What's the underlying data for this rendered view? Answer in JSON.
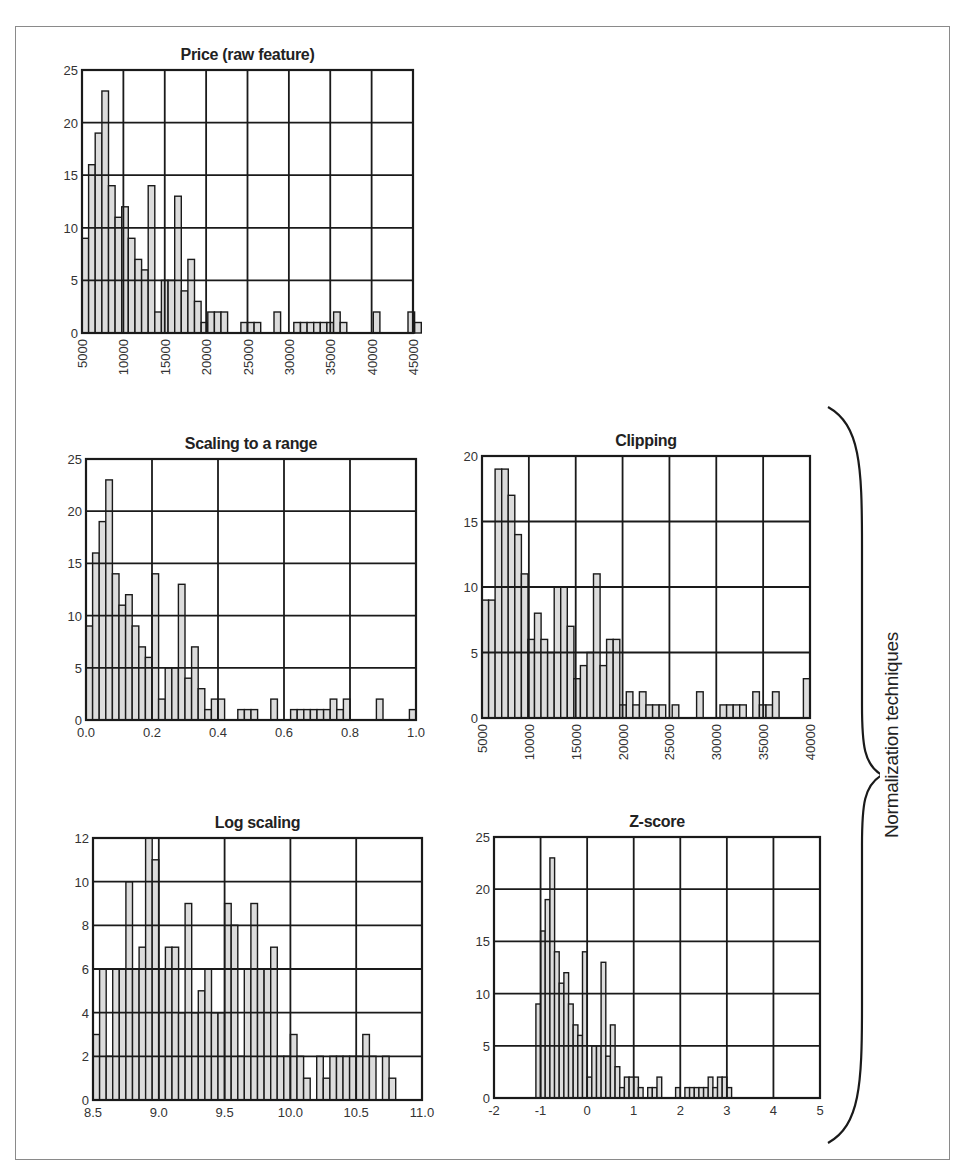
{
  "chart_data": [
    {
      "id": "price",
      "type": "bar",
      "title": "Price (raw feature)",
      "xlabel": "",
      "ylabel": "",
      "xlim": [
        5000,
        45000
      ],
      "ylim": [
        0,
        25
      ],
      "xticks": [
        "5000",
        "10000",
        "15000",
        "20000",
        "25000",
        "30000",
        "35000",
        "40000",
        "45000"
      ],
      "yticks": [
        "0",
        "5",
        "10",
        "15",
        "20",
        "25"
      ],
      "xtick_rotation": -90,
      "grid": true,
      "box": {
        "left": 82,
        "top": 70,
        "right": 413,
        "bottom": 333
      },
      "bin_width": 800,
      "bins": [
        5000,
        5800,
        6600,
        7400,
        8200,
        9000,
        9800,
        10600,
        11400,
        12200,
        13000,
        13800,
        14600,
        15400,
        16200,
        17000,
        17800,
        18600,
        19400,
        20200,
        21000,
        21800,
        24200,
        25000,
        25800,
        28200,
        30600,
        31400,
        32200,
        33000,
        33800,
        34600,
        35400,
        36200,
        40200,
        44400
      ],
      "values": [
        9,
        16,
        19,
        23,
        14,
        11,
        12,
        9,
        7,
        6,
        14,
        2,
        5,
        5,
        13,
        4,
        7,
        3,
        1,
        2,
        2,
        2,
        1,
        1,
        1,
        2,
        1,
        1,
        1,
        1,
        1,
        1,
        2,
        1,
        2,
        2,
        1
      ]
    },
    {
      "id": "scaling",
      "type": "bar",
      "title": "Scaling to a range",
      "xlim": [
        0.0,
        1.0
      ],
      "ylim": [
        0,
        25
      ],
      "xticks": [
        "0.0",
        "0.2",
        "0.4",
        "0.6",
        "0.8",
        "1.0"
      ],
      "yticks": [
        "0",
        "5",
        "10",
        "15",
        "20",
        "25"
      ],
      "xtick_rotation": 0,
      "grid": true,
      "box": {
        "left": 86,
        "top": 459,
        "right": 416,
        "bottom": 720
      },
      "bin_width": 0.02,
      "bins": [
        0.0,
        0.02,
        0.04,
        0.06,
        0.08,
        0.1,
        0.12,
        0.14,
        0.16,
        0.18,
        0.2,
        0.22,
        0.24,
        0.26,
        0.28,
        0.3,
        0.32,
        0.34,
        0.36,
        0.38,
        0.4,
        0.46,
        0.48,
        0.5,
        0.56,
        0.62,
        0.64,
        0.66,
        0.68,
        0.7,
        0.72,
        0.74,
        0.76,
        0.78,
        0.88,
        0.98
      ],
      "values": [
        9,
        16,
        19,
        23,
        14,
        11,
        12,
        9,
        7,
        6,
        14,
        2,
        5,
        5,
        13,
        4,
        7,
        3,
        1,
        2,
        2,
        1,
        1,
        1,
        2,
        1,
        1,
        1,
        1,
        1,
        1,
        2,
        1,
        2,
        2,
        1
      ]
    },
    {
      "id": "clipping",
      "type": "bar",
      "title": "Clipping",
      "xlim": [
        5000,
        40000
      ],
      "ylim": [
        0,
        20
      ],
      "xticks": [
        "5000",
        "10000",
        "15000",
        "20000",
        "25000",
        "30000",
        "35000",
        "40000"
      ],
      "yticks": [
        "0",
        "5",
        "10",
        "15",
        "20"
      ],
      "xtick_rotation": -90,
      "grid": true,
      "box": {
        "left": 482,
        "top": 456,
        "right": 810,
        "bottom": 718
      },
      "bin_width": 700,
      "bins": [
        5000,
        5700,
        6400,
        7100,
        7800,
        8500,
        9200,
        9900,
        10600,
        11300,
        12000,
        12700,
        13400,
        14100,
        14800,
        15500,
        16200,
        16900,
        17600,
        18300,
        19000,
        19700,
        20400,
        21100,
        21800,
        22500,
        23200,
        23900,
        25300,
        27900,
        30400,
        31100,
        31800,
        32500,
        33900,
        34600,
        35300,
        36000,
        39300
      ],
      "values": [
        9,
        9,
        19,
        19,
        17,
        14,
        11,
        6,
        8,
        6,
        5,
        10,
        10,
        7,
        3,
        4,
        5,
        11,
        4,
        6,
        6,
        1,
        2,
        1,
        2,
        1,
        1,
        1,
        1,
        2,
        1,
        1,
        1,
        1,
        2,
        1,
        1,
        2,
        3
      ]
    },
    {
      "id": "log",
      "type": "bar",
      "title": "Log scaling",
      "xlim": [
        8.5,
        11.0
      ],
      "ylim": [
        0,
        12
      ],
      "xticks": [
        "8.5",
        "9.0",
        "9.5",
        "10.0",
        "10.5",
        "11.0"
      ],
      "yticks": [
        "0",
        "2",
        "4",
        "6",
        "8",
        "10",
        "12"
      ],
      "xtick_rotation": 0,
      "grid": true,
      "box": {
        "left": 93,
        "top": 838,
        "right": 422,
        "bottom": 1100
      },
      "bin_width": 0.05,
      "bins": [
        8.5,
        8.55,
        8.6,
        8.65,
        8.7,
        8.75,
        8.8,
        8.85,
        8.9,
        8.95,
        9.0,
        9.05,
        9.1,
        9.15,
        9.2,
        9.25,
        9.3,
        9.35,
        9.4,
        9.45,
        9.5,
        9.55,
        9.6,
        9.65,
        9.7,
        9.75,
        9.8,
        9.85,
        9.9,
        9.95,
        10.0,
        10.05,
        10.1,
        10.2,
        10.25,
        10.3,
        10.35,
        10.4,
        10.45,
        10.5,
        10.55,
        10.6,
        10.7
      ],
      "values": [
        3,
        6,
        2,
        6,
        6,
        10,
        6,
        7,
        12,
        11,
        6,
        7,
        7,
        4,
        9,
        4,
        5,
        6,
        4,
        4,
        9,
        8,
        2,
        6,
        9,
        6,
        6,
        7,
        2,
        2,
        3,
        2,
        1,
        2,
        1,
        2,
        2,
        2,
        2,
        2,
        3,
        2,
        2,
        1
      ]
    },
    {
      "id": "zscore",
      "type": "bar",
      "title": "Z-score",
      "xlim": [
        -2,
        5
      ],
      "ylim": [
        0,
        25
      ],
      "xticks": [
        "-2",
        "-1",
        "0",
        "1",
        "2",
        "3",
        "4",
        "5"
      ],
      "yticks": [
        "0",
        "5",
        "10",
        "15",
        "20",
        "25"
      ],
      "xtick_rotation": 0,
      "grid": true,
      "box": {
        "left": 494,
        "top": 837,
        "right": 820,
        "bottom": 1098
      },
      "bin_width": 0.1,
      "bins": [
        -1.1,
        -1.0,
        -0.9,
        -0.8,
        -0.7,
        -0.6,
        -0.5,
        -0.4,
        -0.3,
        -0.2,
        -0.1,
        0.0,
        0.1,
        0.2,
        0.3,
        0.4,
        0.5,
        0.6,
        0.7,
        0.8,
        0.9,
        1.0,
        1.1,
        1.3,
        1.4,
        1.5,
        1.9,
        2.1,
        2.2,
        2.3,
        2.4,
        2.5,
        2.6,
        2.7,
        2.8,
        2.9,
        3.0,
        3.5,
        3.9
      ],
      "values": [
        9,
        16,
        19,
        23,
        14,
        11,
        12,
        9,
        7,
        6,
        14,
        2,
        5,
        5,
        13,
        4,
        7,
        3,
        1,
        2,
        2,
        2,
        1,
        1,
        1,
        2,
        1,
        1,
        1,
        1,
        1,
        1,
        2,
        1,
        2,
        2,
        1
      ]
    }
  ],
  "annotation": {
    "label": "Normalization techniques",
    "brace_spans": [
      "Scaling to a range",
      "Clipping",
      "Log scaling",
      "Z-score"
    ]
  },
  "colors": {
    "bar_fill": "#dcdcdc",
    "bar_stroke": "#1a1a1a",
    "grid": "#1a1a1a",
    "frame": "#8a8a8a"
  }
}
